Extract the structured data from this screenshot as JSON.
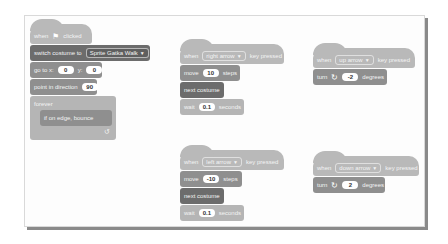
{
  "scripts": {
    "flag": {
      "hat": {
        "when": "when",
        "flag_icon": "green-flag-icon",
        "clicked": "clicked"
      },
      "switch_costume": {
        "label": "switch costume to",
        "value": "Sprite Gatka Walk"
      },
      "go_to": {
        "label_x": "go to x:",
        "x": "0",
        "label_y": "y:",
        "y": "0"
      },
      "point": {
        "label": "point in direction",
        "value": "90"
      },
      "forever": {
        "label": "forever",
        "loop_icon": "↺"
      },
      "bounce": {
        "label": "if on edge, bounce"
      }
    },
    "right": {
      "hat": {
        "when": "when",
        "key": "right arrow",
        "pressed": "key pressed"
      },
      "move": {
        "label": "move",
        "value": "10",
        "unit": "steps"
      },
      "next_costume": {
        "label": "next costume"
      },
      "wait": {
        "label": "wait",
        "value": "0.1",
        "unit": "seconds"
      }
    },
    "up": {
      "hat": {
        "when": "when",
        "key": "up arrow",
        "pressed": "key pressed"
      },
      "turn": {
        "label": "turn",
        "icon": "↻",
        "value": "-2",
        "unit": "degrees"
      }
    },
    "left": {
      "hat": {
        "when": "when",
        "key": "left arrow",
        "pressed": "key pressed"
      },
      "move": {
        "label": "move",
        "value": "-10",
        "unit": "steps"
      },
      "next_costume": {
        "label": "next costume"
      },
      "wait": {
        "label": "wait",
        "value": "0.1",
        "unit": "seconds"
      }
    },
    "down": {
      "hat": {
        "when": "when",
        "key": "down arrow",
        "pressed": "key pressed"
      },
      "turn": {
        "label": "turn",
        "icon": "↻",
        "value": "2",
        "unit": "degrees"
      }
    }
  },
  "dropdown_arrow": "▼"
}
